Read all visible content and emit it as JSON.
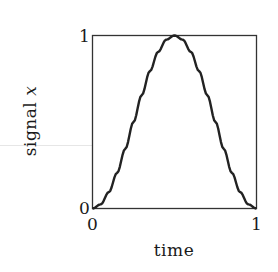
{
  "chart_data": {
    "type": "line",
    "title": "",
    "xlabel": "time",
    "ylabel": "signal",
    "ylabel_variable": "x",
    "xlim": [
      0,
      1
    ],
    "ylim": [
      0,
      1
    ],
    "x_ticks": [
      "0",
      "1"
    ],
    "y_ticks": [
      "0",
      "1"
    ],
    "grid": false,
    "legend": null,
    "series": [
      {
        "name": "signal x",
        "color": "#222222",
        "x": [
          0,
          0.05,
          0.1,
          0.15,
          0.2,
          0.25,
          0.3,
          0.35,
          0.4,
          0.45,
          0.5,
          0.55,
          0.6,
          0.65,
          0.7,
          0.75,
          0.8,
          0.85,
          0.9,
          0.95,
          1
        ],
        "y": [
          0,
          0.024,
          0.095,
          0.206,
          0.345,
          0.5,
          0.655,
          0.794,
          0.905,
          0.976,
          1,
          0.976,
          0.905,
          0.794,
          0.655,
          0.5,
          0.345,
          0.206,
          0.095,
          0.024,
          0
        ]
      }
    ]
  },
  "labels": {
    "y_tick_top": "1",
    "y_tick_bottom": "0",
    "x_tick_left": "0",
    "x_tick_right": "1",
    "xlabel": "time",
    "ylabel_text": "signal ",
    "ylabel_var": "x"
  }
}
